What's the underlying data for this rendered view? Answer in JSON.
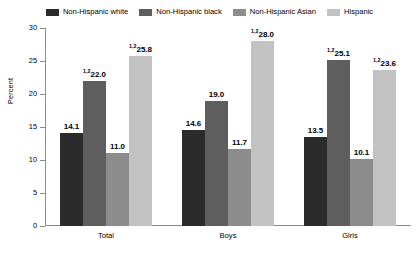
{
  "chart_data": {
    "type": "bar",
    "title": "",
    "subtitle": "",
    "xlabel": "",
    "ylabel": "Percent",
    "ylim": [
      0,
      30
    ],
    "yticks": [
      0,
      5,
      10,
      15,
      20,
      25,
      30
    ],
    "ytick_labels": [
      "0",
      "5",
      "10",
      "15",
      "20",
      "25",
      "30"
    ],
    "grid": false,
    "legend_position": "top-center",
    "categories": [
      "Total",
      "Boys",
      "Girls"
    ],
    "series": [
      {
        "name": "Non-Hispanic white",
        "color": "#2b2b2b",
        "values": [
          14.1,
          14.6,
          13.5
        ],
        "labels": [
          "14.1",
          "14.6",
          "13.5"
        ],
        "footnotes": [
          "",
          "",
          ""
        ]
      },
      {
        "name": "Non-Hispanic black",
        "color": "#5e5e5e",
        "values": [
          22.0,
          19.0,
          25.1
        ],
        "labels": [
          "22.0",
          "19.0",
          "25.1"
        ],
        "footnotes": [
          "1,2",
          "",
          "1,2"
        ]
      },
      {
        "name": "Non-Hispanic Asian",
        "color": "#8c8c8c",
        "values": [
          11.0,
          11.7,
          10.1
        ],
        "labels": [
          "11.0",
          "11.7",
          "10.1"
        ],
        "footnotes": [
          "",
          "",
          ""
        ]
      },
      {
        "name": "Hispanic",
        "color": "#c2c2c2",
        "values": [
          25.8,
          28.0,
          23.6
        ],
        "labels": [
          "25.8",
          "28.0",
          "23.6"
        ],
        "footnotes": [
          "1,2",
          "1,2",
          "1,2"
        ]
      }
    ]
  },
  "legend": {
    "items": [
      {
        "label": "Non-Hispanic white",
        "color": "#2b2b2b"
      },
      {
        "label": "Non-Hispanic black",
        "color": "#5e5e5e"
      },
      {
        "label": "Non-Hispanic Asian",
        "color": "#8c8c8c"
      },
      {
        "label": "Hispanic",
        "color": "#c2c2c2"
      }
    ]
  },
  "axes": {
    "y_title": "Percent",
    "y_tick_labels": [
      "30",
      "25",
      "20",
      "15",
      "10",
      "5",
      "0"
    ],
    "x_tick_labels": [
      "Total",
      "Boys",
      "Girls"
    ]
  }
}
